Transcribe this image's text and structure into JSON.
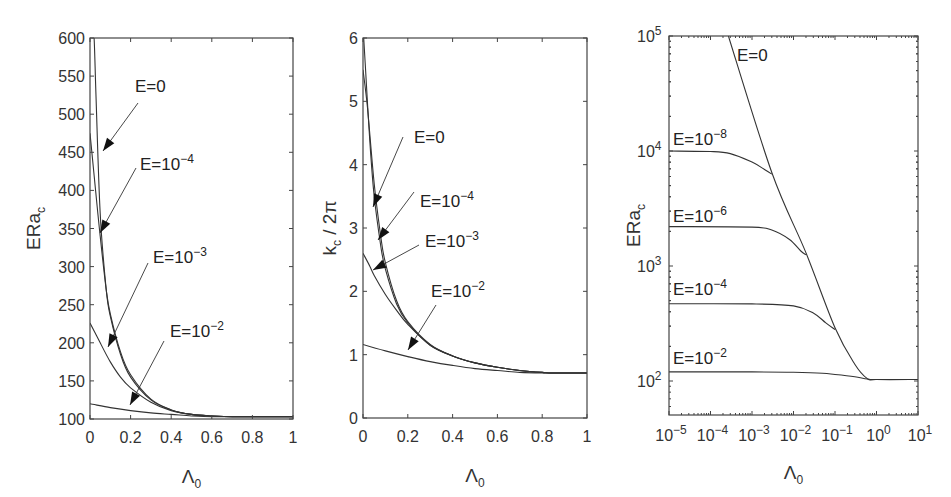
{
  "chart_data": [
    {
      "type": "line",
      "panel": "left",
      "xlabel": "Λ0",
      "ylabel": "ERa_c",
      "xlim": [
        0,
        1
      ],
      "ylim": [
        100,
        600
      ],
      "xticks": [
        "0",
        "0.2",
        "0.4",
        "0.6",
        "0.8",
        "1"
      ],
      "yticks": [
        "100",
        "150",
        "200",
        "250",
        "300",
        "350",
        "400",
        "450",
        "500",
        "550",
        "600"
      ],
      "grid": false,
      "series": [
        {
          "name": "E=0",
          "x": [
            0.01,
            0.02,
            0.03,
            0.05,
            0.08,
            0.1,
            0.15,
            0.2,
            0.3,
            0.4,
            0.5,
            0.6,
            0.7,
            0.8,
            1.0
          ],
          "y": [
            600,
            600,
            520,
            370,
            270,
            235,
            185,
            155,
            125,
            112,
            106,
            104,
            103,
            103,
            103
          ]
        },
        {
          "name": "E=10^-4",
          "x": [
            0,
            0.02,
            0.05,
            0.08,
            0.1,
            0.15,
            0.2,
            0.3,
            0.4,
            0.5,
            0.6,
            0.7,
            0.8,
            1.0
          ],
          "y": [
            475,
            420,
            340,
            270,
            238,
            188,
            158,
            126,
            112,
            106,
            104,
            103,
            103,
            103
          ]
        },
        {
          "name": "E=10^-3",
          "x": [
            0,
            0.05,
            0.1,
            0.15,
            0.2,
            0.3,
            0.4,
            0.5,
            0.6,
            0.7,
            0.8,
            1.0
          ],
          "y": [
            226,
            200,
            175,
            155,
            141,
            122,
            111,
            106,
            104,
            103,
            103,
            103
          ]
        },
        {
          "name": "E=10^-2",
          "x": [
            0,
            0.1,
            0.2,
            0.3,
            0.4,
            0.5,
            0.6,
            0.7,
            0.8,
            1.0
          ],
          "y": [
            120,
            115,
            111,
            108,
            106,
            104,
            103,
            103,
            103,
            103
          ]
        }
      ],
      "annotations": [
        {
          "text": "E=0",
          "exp": "",
          "label_xy": [
            135,
            92
          ],
          "arrow_from": [
            138,
            103
          ],
          "arrow_to": [
            103,
            151
          ]
        },
        {
          "text": "E=10",
          "exp": "−4",
          "label_xy": [
            140,
            170
          ],
          "arrow_from": [
            136,
            168
          ],
          "arrow_to": [
            100,
            233
          ]
        },
        {
          "text": "E=10",
          "exp": "−3",
          "label_xy": [
            153,
            263
          ],
          "arrow_from": [
            148,
            263
          ],
          "arrow_to": [
            108,
            347
          ]
        },
        {
          "text": "E=10",
          "exp": "−2",
          "label_xy": [
            170,
            337
          ],
          "arrow_from": [
            164,
            341
          ],
          "arrow_to": [
            130,
            405
          ]
        }
      ]
    },
    {
      "type": "line",
      "panel": "middle",
      "xlabel": "Λ0",
      "ylabel": "k_c / 2π",
      "xlim": [
        0,
        1
      ],
      "ylim": [
        0,
        6
      ],
      "xticks": [
        "0",
        "0.2",
        "0.4",
        "0.6",
        "0.8",
        "1"
      ],
      "yticks": [
        "0",
        "1",
        "2",
        "3",
        "4",
        "5",
        "6"
      ],
      "grid": false,
      "series": [
        {
          "name": "E=0",
          "x": [
            0.003,
            0.01,
            0.03,
            0.05,
            0.08,
            0.1,
            0.15,
            0.2,
            0.3,
            0.4,
            0.5,
            0.6,
            0.7,
            0.8,
            0.85,
            1.0
          ],
          "y": [
            6.0,
            5.6,
            4.4,
            3.5,
            2.7,
            2.35,
            1.8,
            1.5,
            1.15,
            0.98,
            0.87,
            0.8,
            0.75,
            0.72,
            0.71,
            0.71
          ]
        },
        {
          "name": "E=10^-4",
          "x": [
            0,
            0.02,
            0.05,
            0.08,
            0.1,
            0.15,
            0.2,
            0.3,
            0.4,
            0.5,
            0.6,
            0.7,
            0.8,
            0.85,
            1.0
          ],
          "y": [
            5.5,
            4.9,
            3.7,
            2.85,
            2.45,
            1.85,
            1.52,
            1.16,
            0.98,
            0.87,
            0.8,
            0.75,
            0.72,
            0.71,
            0.71
          ]
        },
        {
          "name": "E=10^-3",
          "x": [
            0,
            0.03,
            0.05,
            0.1,
            0.15,
            0.2,
            0.3,
            0.4,
            0.5,
            0.6,
            0.7,
            0.8,
            0.85,
            1.0
          ],
          "y": [
            2.6,
            2.4,
            2.25,
            1.95,
            1.7,
            1.48,
            1.15,
            0.98,
            0.87,
            0.8,
            0.75,
            0.72,
            0.71,
            0.71
          ]
        },
        {
          "name": "E=10^-2",
          "x": [
            0,
            0.1,
            0.2,
            0.3,
            0.4,
            0.5,
            0.6,
            0.7,
            0.8,
            0.9,
            1.0
          ],
          "y": [
            1.16,
            1.06,
            0.97,
            0.89,
            0.83,
            0.78,
            0.75,
            0.72,
            0.71,
            0.71,
            0.71
          ]
        }
      ],
      "annotations": [
        {
          "text": "E=0",
          "exp": "",
          "label_xy": [
            414,
            143
          ],
          "arrow_from": [
            403,
            137
          ],
          "arrow_to": [
            373,
            207
          ]
        },
        {
          "text": "E=10",
          "exp": "−4",
          "label_xy": [
            420,
            207
          ],
          "arrow_from": [
            414,
            192
          ],
          "arrow_to": [
            378,
            240
          ]
        },
        {
          "text": "E=10",
          "exp": "−3",
          "label_xy": [
            425,
            247
          ],
          "arrow_from": [
            419,
            245
          ],
          "arrow_to": [
            373,
            270
          ]
        },
        {
          "text": "E=10",
          "exp": "−2",
          "label_xy": [
            431,
            297
          ],
          "arrow_from": [
            436,
            305
          ],
          "arrow_to": [
            408,
            350
          ]
        }
      ]
    },
    {
      "type": "line",
      "panel": "right",
      "xlabel": "Λ0",
      "ylabel": "ERa_c",
      "xscale": "log",
      "yscale": "log",
      "xlim": [
        1e-05,
        10
      ],
      "ylim": [
        50,
        100000
      ],
      "xticks": [
        "10^-5",
        "10^-4",
        "10^-3",
        "10^-2",
        "10^-1",
        "10^0",
        "10^1"
      ],
      "yticks": [
        "10^2",
        "10^3",
        "10^4",
        "10^5"
      ],
      "grid": false,
      "series": [
        {
          "name": "E=0",
          "x": [
            0.00027,
            0.003,
            0.02,
            0.1,
            0.3,
            0.6,
            1,
            10
          ],
          "y": [
            100000,
            6500,
            1300,
            290,
            140,
            105,
            103,
            103
          ]
        },
        {
          "name": "E=10^-8",
          "x": [
            1e-05,
            0.0001,
            0.0003,
            0.001,
            0.002,
            0.003
          ],
          "y": [
            10000,
            9900,
            9500,
            8000,
            6900,
            6300
          ]
        },
        {
          "name": "E=10^-6",
          "x": [
            1e-05,
            0.001,
            0.003,
            0.008,
            0.015,
            0.02
          ],
          "y": [
            2200,
            2180,
            2050,
            1700,
            1350,
            1250
          ]
        },
        {
          "name": "E=10^-4",
          "x": [
            1e-05,
            0.001,
            0.01,
            0.03,
            0.06,
            0.1
          ],
          "y": [
            470,
            468,
            450,
            390,
            320,
            280
          ]
        },
        {
          "name": "E=10^-2",
          "x": [
            1e-05,
            0.001,
            0.01,
            0.05,
            0.1,
            0.3,
            0.6,
            1,
            10
          ],
          "y": [
            120,
            120,
            119,
            117,
            114,
            109,
            104,
            103,
            103
          ]
        }
      ],
      "annotations": [
        {
          "text": "E=0",
          "exp": "",
          "label_xy": [
            737,
            61
          ]
        },
        {
          "text": "E=10",
          "exp": "−8",
          "label_xy": [
            673,
            145
          ]
        },
        {
          "text": "E=10",
          "exp": "−6",
          "label_xy": [
            673,
            222
          ]
        },
        {
          "text": "E=10",
          "exp": "−4",
          "label_xy": [
            673,
            295
          ]
        },
        {
          "text": "E=10",
          "exp": "−2",
          "label_xy": [
            673,
            364
          ]
        }
      ]
    }
  ],
  "panels": {
    "left": {
      "ylabel": "ERa",
      "ylabel_sub": "c",
      "xlabel": "Λ",
      "xlabel_sub": "0"
    },
    "middle": {
      "ylabel": "k",
      "ylabel_sub": "c",
      "ylabel_tail": " / 2π",
      "xlabel": "Λ",
      "xlabel_sub": "0"
    },
    "right": {
      "ylabel": "ERa",
      "ylabel_sub": "c",
      "xlabel": "Λ",
      "xlabel_sub": "0"
    }
  }
}
